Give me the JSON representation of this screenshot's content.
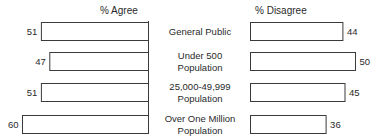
{
  "chart_data": {
    "type": "bar",
    "orientation": "horizontal-diverging",
    "title": "",
    "categories": [
      [
        "General Public"
      ],
      [
        "Under 500",
        "Population"
      ],
      [
        "25,000-49,999",
        "Population"
      ],
      [
        "Over One Million",
        "Population"
      ]
    ],
    "series": [
      {
        "name": "% Agree",
        "side": "left",
        "values": [
          51,
          47,
          51,
          60
        ]
      },
      {
        "name": "% Disagree",
        "side": "right",
        "values": [
          44,
          50,
          45,
          36
        ]
      }
    ],
    "xlim": [
      0,
      60
    ],
    "grid": false,
    "legend": "none"
  }
}
